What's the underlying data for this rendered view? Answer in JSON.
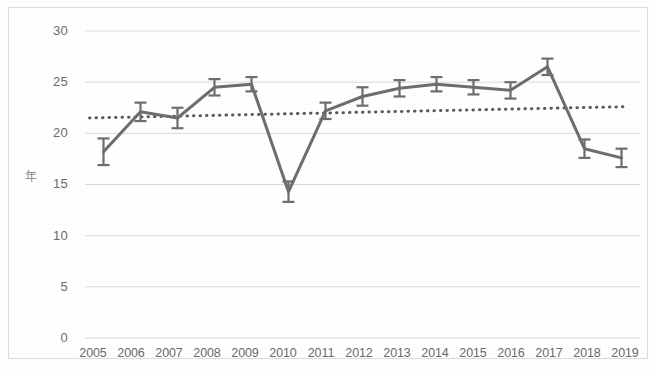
{
  "chart_data": {
    "type": "line",
    "title": "",
    "subtitle": "",
    "xlabel": "",
    "ylabel": "年",
    "ylim": [
      0,
      30
    ],
    "yticks": [
      0,
      5,
      10,
      15,
      20,
      25,
      30
    ],
    "grid": true,
    "legend": "none",
    "categories": [
      "2005",
      "2006",
      "2007",
      "2008",
      "2009",
      "2010",
      "2011",
      "2012",
      "2013",
      "2014",
      "2015",
      "2016",
      "2017",
      "2018",
      "2019"
    ],
    "series": [
      {
        "name": "value",
        "values": [
          18.2,
          22.1,
          21.5,
          24.5,
          24.8,
          14.3,
          22.2,
          23.6,
          24.4,
          24.8,
          24.5,
          24.2,
          26.5,
          18.5,
          17.6
        ],
        "errors": [
          1.3,
          0.9,
          1.0,
          0.8,
          0.7,
          1.0,
          0.8,
          0.9,
          0.8,
          0.7,
          0.7,
          0.8,
          0.8,
          0.9,
          0.9
        ],
        "color": "#6e6e6e",
        "marker": "error-bar",
        "linewidth": 3
      },
      {
        "name": "trendline",
        "type": "dotted-trend",
        "x_start": "2005",
        "x_end": "2019",
        "y_start": 21.5,
        "y_end": 22.6,
        "color": "#5a5a5a",
        "style": "dotted"
      }
    ],
    "annotations": []
  },
  "axis": {
    "y_title": "年",
    "y_tick_labels": [
      "30",
      "25",
      "20",
      "15",
      "10",
      "5",
      "0"
    ],
    "x_tick_labels": [
      "2005",
      "2006",
      "2007",
      "2008",
      "2009",
      "2010",
      "2011",
      "2012",
      "2013",
      "2014",
      "2015",
      "2016",
      "2017",
      "2018",
      "2019"
    ]
  },
  "colors": {
    "series_line": "#6e6e6e",
    "trendline": "#5a5a5a",
    "gridline": "#d9d9d9",
    "axis_text": "#6b6b6b",
    "frame_border": "#dcdcdc",
    "background": "#ffffff"
  }
}
